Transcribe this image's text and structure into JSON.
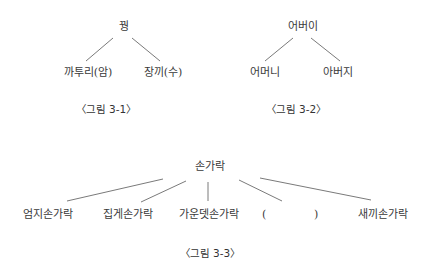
{
  "figures": [
    {
      "id": "fig-3-1",
      "caption": "〈그림 3-1〉",
      "root": "꿩",
      "children": [
        "까투리(암)",
        "장끼(수)"
      ]
    },
    {
      "id": "fig-3-2",
      "caption": "〈그림 3-2〉",
      "root": "어버이",
      "children": [
        "어머니",
        "아버지"
      ]
    },
    {
      "id": "fig-3-3",
      "caption": "〈그림 3-3〉",
      "root": "손가락",
      "children": [
        "엄지손가락",
        "집게손가락",
        "가운뎃손가락",
        "(",
        ")",
        "새끼손가락"
      ]
    }
  ],
  "colors": {
    "line": "#7a7a7a",
    "text": "#333333",
    "background": "#ffffff"
  }
}
